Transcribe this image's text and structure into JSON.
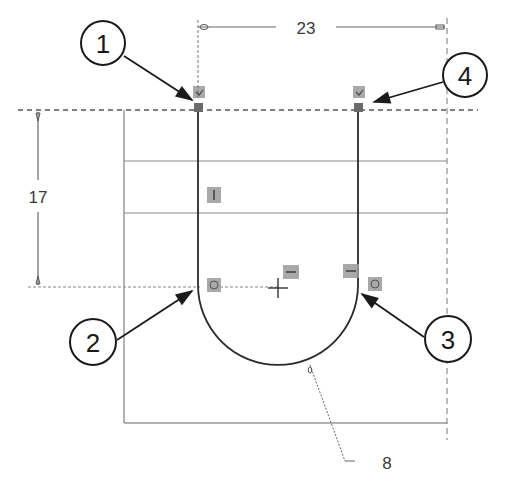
{
  "diagram": {
    "type": "cad-sketch-slot",
    "colors": {
      "sketch_line": "#2a2a2a",
      "construction_line": "#555555",
      "dimension_line": "#6a6a6a",
      "relation_icon": "#9a9a9a",
      "background": "#ffffff"
    },
    "dimensions": {
      "width": {
        "value": "23",
        "orientation": "horizontal"
      },
      "height": {
        "value": "17",
        "orientation": "vertical"
      },
      "radius": {
        "value": "8",
        "orientation": "leader"
      }
    },
    "callouts": [
      {
        "id": "callout-1",
        "label": "1"
      },
      {
        "id": "callout-2",
        "label": "2"
      },
      {
        "id": "callout-3",
        "label": "3"
      },
      {
        "id": "callout-4",
        "label": "4"
      }
    ],
    "relations": [
      {
        "name": "coincident-top-left",
        "glyph": "coincident"
      },
      {
        "name": "coincident-top-right",
        "glyph": "coincident"
      },
      {
        "name": "vertical-left-line",
        "glyph": "vertical"
      },
      {
        "name": "tangent-left",
        "glyph": "tangent"
      },
      {
        "name": "tangent-right",
        "glyph": "tangent"
      },
      {
        "name": "horizontal-center",
        "glyph": "horizontal"
      },
      {
        "name": "horizontal-right",
        "glyph": "horizontal"
      }
    ],
    "origin_marker": "+"
  }
}
